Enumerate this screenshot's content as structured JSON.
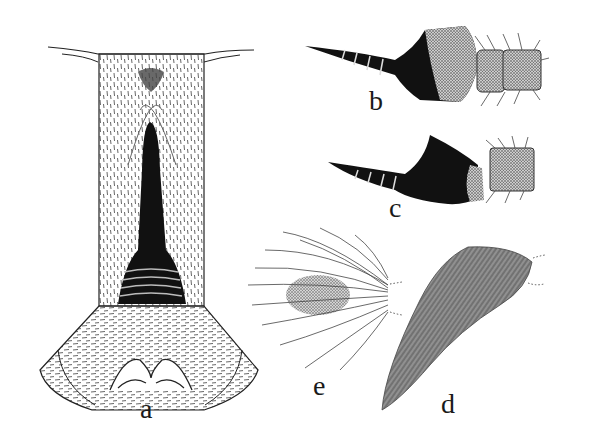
{
  "figure": {
    "panels": [
      {
        "id": "a",
        "label": "a",
        "description": "ventral view of abdominal segment with dark elongate sclerite and lobed base"
      },
      {
        "id": "b",
        "label": "b",
        "description": "lateral view of appendage with dark tapering spine and setose segments"
      },
      {
        "id": "c",
        "label": "c",
        "description": "lateral view of shorter appendage with dark tapering spine and setose segment"
      },
      {
        "id": "d",
        "label": "d",
        "description": "elongate densely hairy lobe"
      },
      {
        "id": "e",
        "label": "e",
        "description": "rounded lobe with long radiating setae"
      }
    ],
    "colors": {
      "ink": "#111111",
      "paper": "#ffffff",
      "hatch": "#555555"
    }
  }
}
